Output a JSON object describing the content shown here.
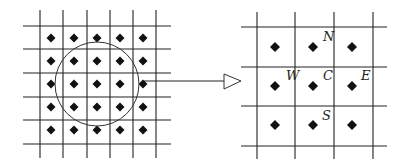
{
  "diagram": {
    "colors": {
      "line": "#222222",
      "dot": "#111111",
      "background": "#ffffff"
    },
    "left_grid": {
      "vertical_lines_x": [
        40,
        63,
        87,
        110,
        133,
        156
      ],
      "vertical_span_y": [
        10,
        158
      ],
      "horizontal_lines_y": [
        26,
        49,
        73,
        97,
        120,
        144
      ],
      "horizontal_span_x": [
        23,
        171
      ],
      "dot_columns_x": [
        51,
        74,
        97,
        120,
        143
      ],
      "dot_rows_y": [
        38,
        61,
        84,
        107,
        130
      ],
      "circle": {
        "cx": 97,
        "cy": 84,
        "r": 42
      }
    },
    "arrow": {
      "from": [
        142,
        81
      ],
      "to": [
        224,
        81
      ],
      "head": {
        "base_x": 224,
        "top_y": 74,
        "bottom_y": 89,
        "tip_x": 241
      }
    },
    "right_grid": {
      "vertical_lines_x": [
        257,
        295,
        334,
        373
      ],
      "vertical_span_y": [
        12,
        159
      ],
      "horizontal_lines_y": [
        27,
        67,
        106,
        146
      ],
      "horizontal_span_x": [
        241,
        387
      ],
      "dot_columns_x": [
        275,
        313,
        352
      ],
      "dot_rows_y": [
        47,
        86,
        125
      ]
    },
    "labels": [
      {
        "text": "N",
        "x": 318,
        "y": 42,
        "name": "north"
      },
      {
        "text": "W",
        "x": 281,
        "y": 81,
        "name": "west"
      },
      {
        "text": "C",
        "x": 318,
        "y": 81,
        "name": "center"
      },
      {
        "text": "E",
        "x": 356,
        "y": 81,
        "name": "east"
      },
      {
        "text": "S",
        "x": 317,
        "y": 121,
        "name": "south"
      }
    ]
  }
}
